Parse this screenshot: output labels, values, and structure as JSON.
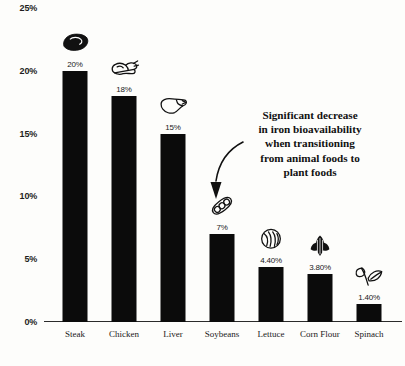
{
  "chart_data": {
    "type": "bar",
    "title": "",
    "xlabel": "",
    "ylabel": "",
    "ylim": [
      0,
      25
    ],
    "grid": false,
    "legend": "none",
    "categories": [
      "Steak",
      "Chicken",
      "Liver",
      "Soybeans",
      "Lettuce",
      "Corn Flour",
      "Spinach"
    ],
    "values": [
      20,
      18,
      15,
      7,
      4.4,
      3.8,
      1.4
    ],
    "value_labels": [
      "20%",
      "18%",
      "15%",
      "7%",
      "4.40%",
      "3.80%",
      "1.40%"
    ],
    "icons": [
      "steak-icon",
      "chicken-icon",
      "liver-icon",
      "soybeans-icon",
      "lettuce-icon",
      "corn-icon",
      "spinach-icon"
    ],
    "y_ticks": [
      {
        "value": 25,
        "label": "25%"
      },
      {
        "value": 20,
        "label": "20%"
      },
      {
        "value": 15,
        "label": "15%"
      },
      {
        "value": 10,
        "label": "10%"
      },
      {
        "value": 5,
        "label": "5%"
      },
      {
        "value": 0,
        "label": "0%"
      }
    ],
    "bar_color": "#0b0b0b",
    "background_color": "#fdfdfb",
    "annotations": [
      {
        "name": "bioavailability-note",
        "lines": [
          "Significant decrease",
          "in iron bioavailability",
          "when transitioning",
          "from animal foods to",
          "plant foods"
        ],
        "arrow": "curved-down-arrow"
      }
    ]
  }
}
